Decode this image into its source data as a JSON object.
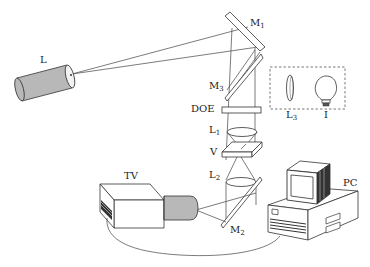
{
  "diagram": {
    "type": "optical-setup-schematic",
    "colors": {
      "line": "#444444",
      "fill_gray": "#b8b8b8",
      "fill_white": "#ffffff",
      "dashed_box": "#555555"
    },
    "labels": {
      "laser": "L",
      "mirror1": {
        "base": "M",
        "sub": "1"
      },
      "mirror2": {
        "base": "M",
        "sub": "2"
      },
      "mirror3": {
        "base": "M",
        "sub": "3"
      },
      "doe": "DOE",
      "lens1": {
        "base": "L",
        "sub": "1"
      },
      "lens2": {
        "base": "L",
        "sub": "2"
      },
      "lens3": {
        "base": "L",
        "sub": "3"
      },
      "sample": "V",
      "lamp": "I",
      "camera": "TV",
      "computer": "PC"
    },
    "components": [
      {
        "id": "laser",
        "label": "L",
        "description": "Laser source (gray cylinder)"
      },
      {
        "id": "m1",
        "label": "M1",
        "description": "Mirror 1 (tilted plate, top)"
      },
      {
        "id": "m3",
        "label": "M3",
        "description": "Mirror 3 (tilted plate)"
      },
      {
        "id": "doe",
        "label": "DOE",
        "description": "Diffractive optical element"
      },
      {
        "id": "l1",
        "label": "L1",
        "description": "Lens 1"
      },
      {
        "id": "v",
        "label": "V",
        "description": "Sample slab"
      },
      {
        "id": "l2",
        "label": "L2",
        "description": "Lens 2"
      },
      {
        "id": "m2",
        "label": "M2",
        "description": "Mirror 2 (tilted plate, bottom)"
      },
      {
        "id": "l3",
        "label": "L3",
        "description": "Lens 3 (inside dashed box)"
      },
      {
        "id": "lamp",
        "label": "I",
        "description": "Illumination lamp (inside dashed box)"
      },
      {
        "id": "tv",
        "label": "TV",
        "description": "TV camera"
      },
      {
        "id": "pc",
        "label": "PC",
        "description": "Personal computer"
      }
    ],
    "connections": [
      {
        "from": "laser",
        "to": "m1",
        "type": "beam"
      },
      {
        "from": "m1",
        "to": "m3",
        "type": "beam"
      },
      {
        "from": "m3",
        "to": "doe",
        "type": "beam"
      },
      {
        "from": "doe",
        "to": "l1",
        "type": "beam"
      },
      {
        "from": "l1",
        "to": "v",
        "type": "beam"
      },
      {
        "from": "v",
        "to": "l2",
        "type": "beam"
      },
      {
        "from": "l2",
        "to": "m2",
        "type": "beam"
      },
      {
        "from": "m2",
        "to": "tv",
        "type": "beam"
      },
      {
        "from": "tv",
        "to": "pc",
        "type": "cable"
      }
    ]
  }
}
